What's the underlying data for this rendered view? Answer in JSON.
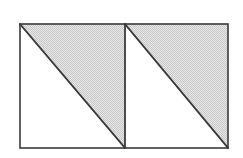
{
  "figure": {
    "clipped_label_text": "1 1",
    "background_color": "#ffffff",
    "stroke_color": "#3a3a3a",
    "shade_color": "#d9d9d9",
    "shade_pattern": "dither-halftone-light-gray",
    "stroke_width_outer": 1.6,
    "stroke_width_diagonal": 1.8,
    "stroke_width_divider": 1.8,
    "rect": {
      "left": 20,
      "top": 24,
      "right": 228,
      "bottom": 148,
      "width": 208,
      "height": 124
    },
    "divider_x": 125,
    "shapes": [
      {
        "name": "left-square",
        "x0": 20,
        "y0": 24,
        "x1": 125,
        "y1": 148,
        "diagonal": "top-left-to-bottom-right",
        "shaded_half": "upper-right",
        "unshaded_half": "lower-left"
      },
      {
        "name": "right-square",
        "x0": 125,
        "y0": 24,
        "x1": 228,
        "y1": 148,
        "diagonal": "top-left-to-bottom-right",
        "shaded_half": "upper-right",
        "unshaded_half": "lower-left"
      }
    ],
    "shaded_polygons": [
      {
        "name": "left-upper-triangle",
        "points": "20,24 125,24 125,148"
      },
      {
        "name": "right-upper-triangle",
        "points": "125,24 228,24 228,148"
      }
    ],
    "unshaded_polygons": [
      {
        "name": "left-lower-triangle",
        "points": "20,24 125,148 20,148"
      },
      {
        "name": "right-lower-triangle",
        "points": "125,24 228,148 125,148"
      }
    ],
    "lines": [
      {
        "name": "diagonal-left",
        "x1": 20,
        "y1": 24,
        "x2": 125,
        "y2": 148
      },
      {
        "name": "diagonal-right",
        "x1": 125,
        "y1": 24,
        "x2": 228,
        "y2": 148
      },
      {
        "name": "divider-vertical",
        "x1": 125,
        "y1": 24,
        "x2": 125,
        "y2": 148
      }
    ]
  }
}
